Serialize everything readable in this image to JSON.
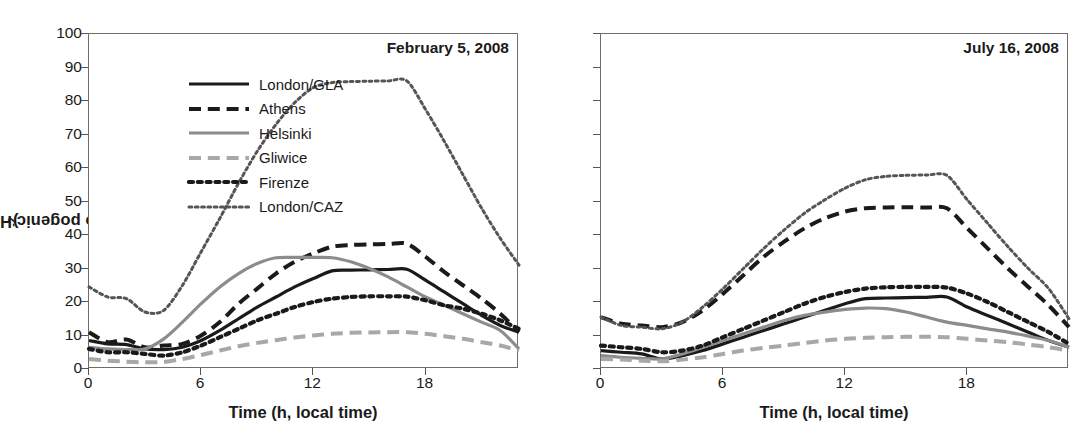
{
  "figure": {
    "ylabel_main": "Anthro pogenic Heat Flux (W m",
    "ylabel_sup": "-2",
    "ylabel_close": ")",
    "xlabel": "Time (h, local time)",
    "yticks": [
      "0",
      "10",
      "20",
      "30",
      "40",
      "50",
      "60",
      "70",
      "80",
      "90",
      "100"
    ],
    "xticks": [
      "0",
      "6",
      "12",
      "18"
    ]
  },
  "legend": {
    "items": [
      {
        "label": "London/GLA",
        "color": "#1a1a1a",
        "width": 3.2,
        "dash": "none",
        "icon": "solid-black-line-icon"
      },
      {
        "label": "Athens",
        "color": "#1a1a1a",
        "width": 4.0,
        "dash": "long",
        "icon": "dashed-black-line-icon"
      },
      {
        "label": "Helsinki",
        "color": "#8c8c8c",
        "width": 3.2,
        "dash": "none",
        "icon": "solid-gray-line-icon"
      },
      {
        "label": "Gliwice",
        "color": "#a8a8a8",
        "width": 4.0,
        "dash": "long",
        "icon": "dashed-gray-line-icon"
      },
      {
        "label": "Firenze",
        "color": "#1a1a1a",
        "width": 4.2,
        "dash": "dot",
        "icon": "dotted-black-line-icon"
      },
      {
        "label": "London/CAZ",
        "color": "#555555",
        "width": 3.0,
        "dash": "dot",
        "icon": "dotted-gray-line-icon"
      }
    ]
  },
  "chart_data": {
    "type": "line",
    "xlabel": "Time (h, local time)",
    "ylabel": "Anthro pogenic Heat Flux (W m-2)",
    "xlim": [
      0,
      23
    ],
    "ylim": [
      0,
      100
    ],
    "yticks": [
      0,
      10,
      20,
      30,
      40,
      50,
      60,
      70,
      80,
      90,
      100
    ],
    "xticks": [
      0,
      6,
      12,
      18
    ],
    "grid": false,
    "legend_position": "top-left (panel 1)",
    "panels": [
      {
        "name": "panel-winter",
        "title": "February 5, 2008",
        "x": [
          0,
          1,
          2,
          3,
          4,
          5,
          6,
          7,
          8,
          9,
          10,
          11,
          12,
          13,
          14,
          15,
          16,
          17,
          18,
          19,
          20,
          21,
          22,
          23
        ],
        "series": [
          {
            "name": "London/GLA",
            "values": [
              8.5,
              7.5,
              7.3,
              6.0,
              5.8,
              6.5,
              8.5,
              11.5,
              15.0,
              18.5,
              21.5,
              24.5,
              27.0,
              29.3,
              29.5,
              29.6,
              29.7,
              29.8,
              26.5,
              23.0,
              19.5,
              16.0,
              13.0,
              11.0
            ]
          },
          {
            "name": "Athens",
            "values": [
              11.0,
              8.0,
              8.8,
              6.5,
              7.0,
              7.5,
              10.0,
              14.0,
              19.5,
              24.0,
              28.5,
              32.0,
              34.5,
              36.5,
              37.0,
              37.2,
              37.3,
              37.4,
              33.5,
              29.0,
              25.0,
              21.0,
              16.5,
              11.0
            ]
          },
          {
            "name": "Helsinki",
            "values": [
              6.5,
              6.0,
              5.8,
              6.0,
              9.0,
              14.0,
              19.5,
              24.5,
              28.5,
              31.5,
              33.2,
              33.3,
              33.3,
              33.2,
              32.0,
              30.0,
              27.5,
              24.5,
              21.5,
              19.0,
              16.5,
              14.0,
              11.5,
              6.0
            ]
          },
          {
            "name": "Gliwice",
            "values": [
              3.0,
              2.5,
              2.2,
              2.0,
              2.1,
              3.0,
              4.2,
              5.5,
              6.8,
              7.8,
              8.6,
              9.4,
              10.0,
              10.5,
              10.8,
              10.9,
              11.0,
              11.0,
              10.5,
              9.8,
              9.0,
              8.0,
              7.0,
              5.5
            ]
          },
          {
            "name": "Firenze",
            "values": [
              6.0,
              5.0,
              5.0,
              4.5,
              4.0,
              5.0,
              7.0,
              9.5,
              12.0,
              14.5,
              16.5,
              18.5,
              20.0,
              21.0,
              21.5,
              21.7,
              21.7,
              21.6,
              20.5,
              19.0,
              18.0,
              16.5,
              14.5,
              12.0
            ]
          },
          {
            "name": "London/CAZ",
            "values": [
              24.5,
              21.5,
              21.0,
              17.0,
              17.5,
              25.0,
              35.0,
              45.0,
              55.5,
              65.0,
              73.0,
              79.5,
              84.0,
              85.5,
              85.8,
              85.9,
              86.0,
              86.0,
              77.5,
              68.0,
              58.0,
              48.0,
              39.0,
              31.0
            ]
          }
        ]
      },
      {
        "name": "panel-summer",
        "title": "July 16, 2008",
        "x": [
          0,
          1,
          2,
          3,
          4,
          5,
          6,
          7,
          8,
          9,
          10,
          11,
          12,
          13,
          14,
          15,
          16,
          17,
          18,
          19,
          20,
          21,
          22,
          23
        ],
        "series": [
          {
            "name": "London/GLA",
            "values": [
              5.5,
              5.0,
              4.5,
              3.0,
              4.0,
              5.5,
              7.5,
              9.5,
              11.5,
              13.5,
              15.5,
              17.5,
              19.5,
              21.0,
              21.2,
              21.3,
              21.4,
              21.5,
              18.5,
              16.0,
              13.5,
              11.0,
              8.5,
              6.5
            ]
          },
          {
            "name": "Athens",
            "values": [
              15.5,
              13.5,
              13.0,
              12.5,
              14.0,
              17.5,
              22.5,
              28.0,
              33.5,
              38.0,
              42.0,
              45.0,
              47.0,
              48.0,
              48.2,
              48.3,
              48.2,
              48.0,
              42.0,
              36.0,
              30.0,
              24.5,
              19.0,
              12.5
            ]
          },
          {
            "name": "Helsinki",
            "values": [
              4.0,
              3.5,
              3.2,
              3.0,
              4.5,
              6.5,
              8.5,
              10.5,
              12.5,
              14.5,
              16.0,
              17.0,
              17.8,
              18.2,
              18.0,
              17.0,
              15.5,
              14.0,
              13.0,
              12.0,
              11.0,
              9.8,
              8.5,
              6.5
            ]
          },
          {
            "name": "Gliwice",
            "values": [
              3.0,
              2.8,
              2.5,
              2.3,
              2.8,
              3.5,
              4.5,
              5.5,
              6.3,
              7.0,
              7.8,
              8.5,
              9.0,
              9.3,
              9.5,
              9.6,
              9.6,
              9.5,
              9.0,
              8.5,
              8.0,
              7.3,
              6.5,
              5.5
            ]
          },
          {
            "name": "Firenze",
            "values": [
              7.0,
              6.5,
              6.0,
              5.0,
              5.5,
              7.0,
              9.5,
              12.0,
              14.5,
              17.0,
              19.5,
              21.5,
              23.0,
              24.0,
              24.4,
              24.5,
              24.5,
              24.3,
              22.5,
              20.0,
              17.0,
              14.0,
              11.0,
              7.5
            ]
          },
          {
            "name": "London/CAZ",
            "values": [
              15.5,
              13.0,
              12.5,
              12.0,
              14.0,
              18.5,
              24.0,
              30.0,
              36.0,
              41.5,
              46.5,
              50.5,
              54.0,
              56.5,
              57.5,
              57.8,
              57.9,
              57.8,
              50.5,
              43.5,
              36.5,
              30.0,
              24.0,
              15.0
            ]
          }
        ]
      }
    ]
  }
}
